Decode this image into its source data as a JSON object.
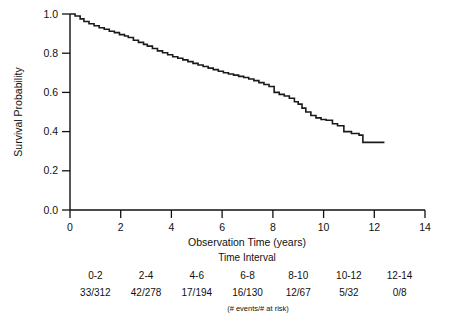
{
  "chart_data": {
    "type": "line",
    "title": "",
    "xlabel": "Observation Time (years)",
    "ylabel": "Survival Probability",
    "xlim": [
      0,
      14
    ],
    "ylim": [
      0.0,
      1.0
    ],
    "xticks": [
      "0",
      "2",
      "4",
      "6",
      "8",
      "10",
      "12",
      "14"
    ],
    "xtick_values": [
      0,
      2,
      4,
      6,
      8,
      10,
      12,
      14
    ],
    "yticks": [
      "0.0",
      "0.2",
      "0.4",
      "0.6",
      "0.8",
      "1.0"
    ],
    "ytick_values": [
      0.0,
      0.2,
      0.4,
      0.6,
      0.8,
      1.0
    ],
    "grid": false,
    "legend": "none",
    "series": [
      {
        "name": "Kaplan-Meier survival estimate",
        "x": [
          0.0,
          0.2,
          0.4,
          0.55,
          0.75,
          0.95,
          1.15,
          1.35,
          1.55,
          1.75,
          1.95,
          2.15,
          2.3,
          2.5,
          2.7,
          2.9,
          3.05,
          3.25,
          3.45,
          3.65,
          3.85,
          4.05,
          4.25,
          4.45,
          4.65,
          4.85,
          5.05,
          5.25,
          5.45,
          5.65,
          5.85,
          6.05,
          6.25,
          6.45,
          6.65,
          6.85,
          7.05,
          7.25,
          7.45,
          7.65,
          7.85,
          8.05,
          8.25,
          8.45,
          8.65,
          8.85,
          9.0,
          9.15,
          9.3,
          9.5,
          9.7,
          9.9,
          10.1,
          10.35,
          10.55,
          10.8,
          11.1,
          11.4,
          11.55,
          12.4
        ],
        "y": [
          1.0,
          0.99,
          0.975,
          0.962,
          0.95,
          0.94,
          0.93,
          0.922,
          0.912,
          0.905,
          0.895,
          0.888,
          0.88,
          0.866,
          0.855,
          0.845,
          0.836,
          0.824,
          0.812,
          0.802,
          0.792,
          0.782,
          0.774,
          0.766,
          0.757,
          0.748,
          0.74,
          0.732,
          0.724,
          0.716,
          0.708,
          0.7,
          0.694,
          0.688,
          0.682,
          0.676,
          0.668,
          0.66,
          0.65,
          0.64,
          0.63,
          0.6,
          0.59,
          0.582,
          0.57,
          0.552,
          0.54,
          0.52,
          0.5,
          0.482,
          0.47,
          0.462,
          0.458,
          0.44,
          0.43,
          0.4,
          0.39,
          0.382,
          0.345,
          0.345
        ]
      }
    ],
    "risk_table": {
      "title": "Time Interval",
      "footnote": "(# events/# at risk)",
      "columns": [
        "0-2",
        "2-4",
        "4-6",
        "6-8",
        "8-10",
        "10-12",
        "12-14"
      ],
      "column_centers": [
        1,
        3,
        5,
        7,
        9,
        11,
        13
      ],
      "values": [
        "33/312",
        "42/278",
        "17/194",
        "16/130",
        "12/67",
        "5/32",
        "0/8"
      ],
      "events": [
        33,
        42,
        17,
        16,
        12,
        5,
        0
      ],
      "at_risk": [
        312,
        278,
        194,
        130,
        67,
        32,
        8
      ]
    },
    "curve_color": "#1a1a1a",
    "axis_color": "#111111",
    "background": "#ffffff"
  }
}
